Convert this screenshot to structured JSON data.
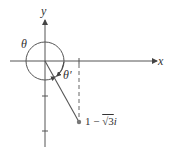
{
  "diagram": {
    "type": "complex-plane-argument",
    "axes": {
      "x_label": "x",
      "y_label": "y"
    },
    "angles": {
      "theta_label": "θ",
      "theta_prime_label": "θ′"
    },
    "point": {
      "label_prefix": "1 − ",
      "label_sqrt": "√3",
      "label_suffix": "i",
      "real": 1,
      "imag": -1.732
    },
    "colors": {
      "stroke": "#555555",
      "point": "#777777"
    }
  }
}
